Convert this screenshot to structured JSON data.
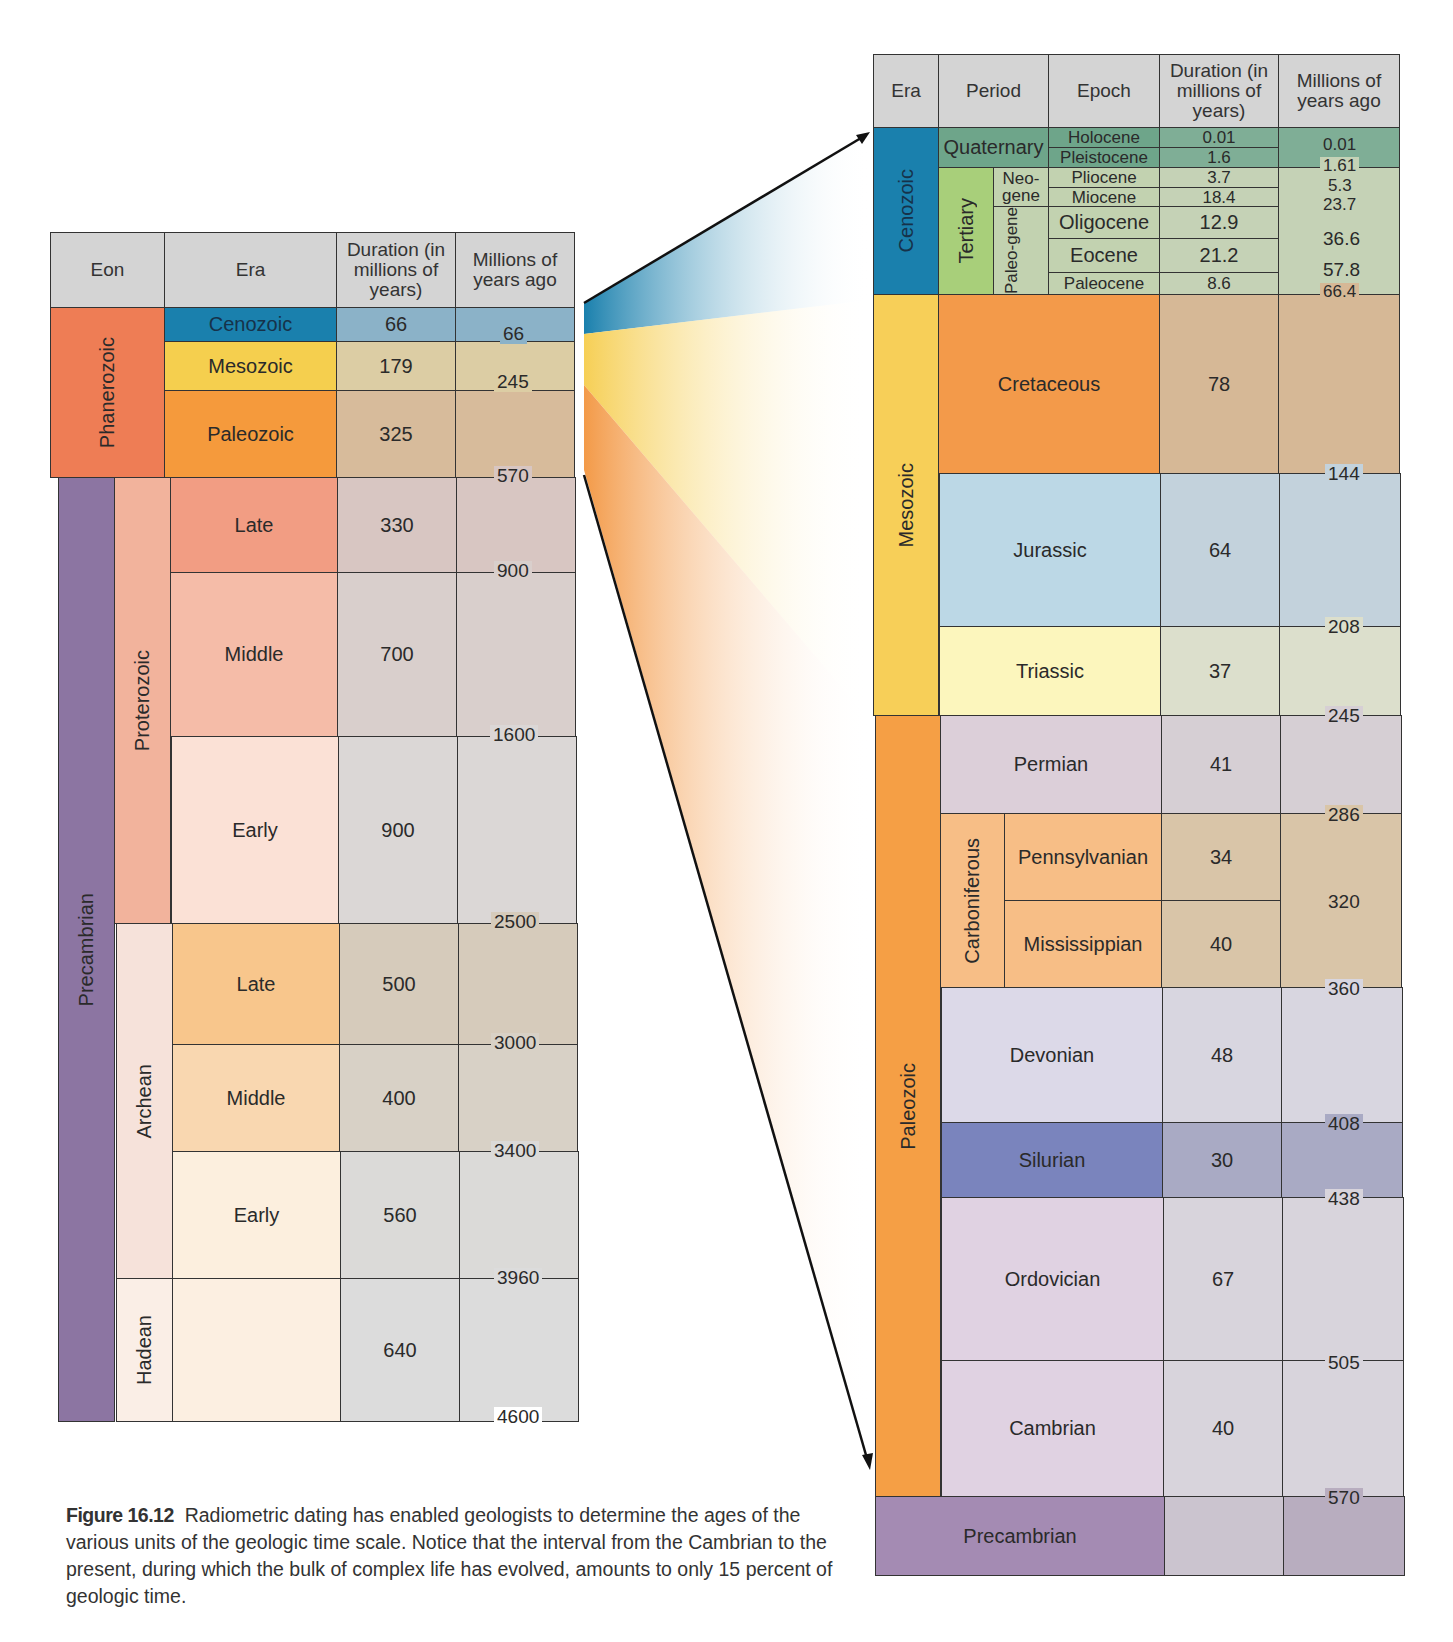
{
  "page_number_fragment": "366",
  "left_table": {
    "headers": {
      "eon": "Eon",
      "era": "Era",
      "duration": "Duration (in millions of years)",
      "mya": "Millions of years ago"
    },
    "eons": [
      {
        "name": "Phanerozoic",
        "color": "#ee7d55"
      },
      {
        "name": "Precambrian",
        "color": "#8c75a2"
      }
    ],
    "sub_eons": [
      {
        "name": "Proterozoic",
        "color": "#f2b39c"
      },
      {
        "name": "Archean",
        "color": "#f6e2da"
      },
      {
        "name": "Hadean",
        "color": "#faeee6"
      }
    ],
    "rows": [
      {
        "era": "Cenozoic",
        "duration": "66",
        "color": "#1a80ad"
      },
      {
        "era": "Mesozoic",
        "duration": "179",
        "color": "#f5cf4e"
      },
      {
        "era": "Paleozoic",
        "duration": "325",
        "color": "#f59a3c"
      },
      {
        "era": "Late",
        "duration": "330",
        "color": "#f29d83"
      },
      {
        "era": "Middle",
        "duration": "700",
        "color": "#f5bca8"
      },
      {
        "era": "Early",
        "duration": "900",
        "color": "#fbe1d6"
      },
      {
        "era": "Late",
        "duration": "500",
        "color": "#f8c68c"
      },
      {
        "era": "Middle",
        "duration": "400",
        "color": "#f9d7b0"
      },
      {
        "era": "Early",
        "duration": "560",
        "color": "#fcefde"
      },
      {
        "era": "",
        "duration": "640",
        "color": "#fcefe1"
      }
    ],
    "boundaries": [
      "66",
      "245",
      "570",
      "900",
      "1600",
      "2500",
      "3000",
      "3400",
      "3960",
      "4600"
    ]
  },
  "right_table": {
    "headers": {
      "era": "Era",
      "period": "Period",
      "epoch": "Epoch",
      "duration": "Duration (in millions of years)",
      "mya": "Millions of years ago"
    },
    "eras": [
      {
        "name": "Cenozoic",
        "color": "#1a80ad"
      },
      {
        "name": "Mesozoic",
        "color": "#f7cf58"
      },
      {
        "name": "Paleozoic",
        "color": "#f59f45"
      },
      {
        "name": "Precambrian",
        "color": "#a48bb3"
      }
    ],
    "cenozoic": {
      "quaternary": "Quaternary",
      "tertiary": "Tertiary",
      "neogene": "Neo-gene",
      "paleogene": "Paleo-gene",
      "epochs": [
        {
          "name": "Holocene",
          "duration": "0.01"
        },
        {
          "name": "Pleistocene",
          "duration": "1.6"
        },
        {
          "name": "Pliocene",
          "duration": "3.7"
        },
        {
          "name": "Miocene",
          "duration": "18.4"
        },
        {
          "name": "Oligocene",
          "duration": "12.9"
        },
        {
          "name": "Eocene",
          "duration": "21.2"
        },
        {
          "name": "Paleocene",
          "duration": "8.6"
        }
      ],
      "boundaries": [
        "0.01",
        "1.61",
        "5.3",
        "23.7",
        "36.6",
        "57.8",
        "66.4"
      ]
    },
    "periods": [
      {
        "name": "Cretaceous",
        "duration": "78",
        "color": "#f39a4a"
      },
      {
        "name": "Jurassic",
        "duration": "64",
        "color": "#bcd8e6"
      },
      {
        "name": "Triassic",
        "duration": "37",
        "color": "#fcf6bd"
      },
      {
        "name": "Permian",
        "duration": "41",
        "color": "#dccfd9"
      },
      {
        "name": "Pennsylvanian",
        "duration": "34",
        "color": "#f7be86"
      },
      {
        "name": "Mississippian",
        "duration": "40",
        "color": "#f7be86"
      },
      {
        "name": "Devonian",
        "duration": "48",
        "color": "#dcd9e8"
      },
      {
        "name": "Silurian",
        "duration": "30",
        "color": "#7a84bd"
      },
      {
        "name": "Ordovician",
        "duration": "67",
        "color": "#e0d2e2"
      },
      {
        "name": "Cambrian",
        "duration": "40",
        "color": "#e0d2e2"
      }
    ],
    "carboniferous": "Carboniferous",
    "precambrian_label": "Precambrian",
    "boundaries": [
      "144",
      "208",
      "245",
      "286",
      "320",
      "360",
      "408",
      "438",
      "505",
      "570"
    ]
  },
  "caption": {
    "figure_label": "Figure 16.12",
    "text": "Radiometric dating has enabled geologists to determine the ages of the various units of the geologic time scale. Notice that the interval from the Cambrian to the present, during which the bulk of complex life has evolved, amounts to only 15 percent of geologic time."
  }
}
